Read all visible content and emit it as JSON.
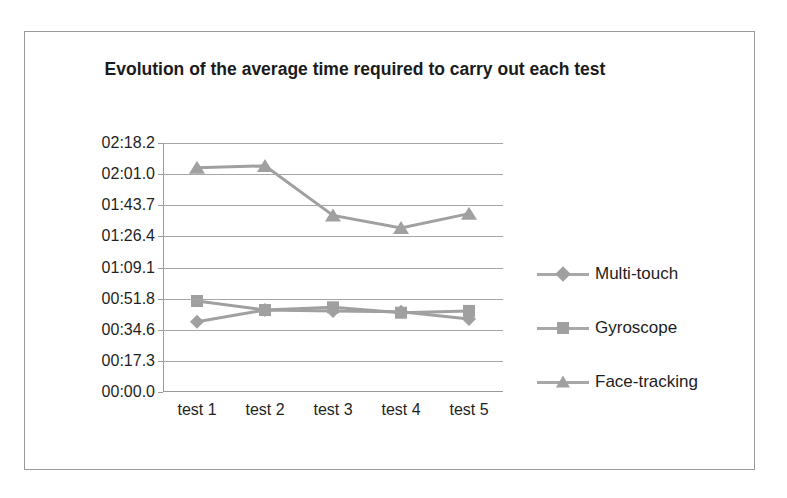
{
  "top_cut_text": "",
  "chart_data": {
    "type": "line",
    "title": "Evolution of the average time required to carry out each test",
    "xlabel": "",
    "ylabel": "",
    "categories": [
      "test 1",
      "test 2",
      "test 3",
      "test 4",
      "test 5"
    ],
    "y_tick_labels": [
      "02:18.2",
      "02:01.0",
      "01:43.7",
      "01:26.4",
      "01:09.1",
      "00:51.8",
      "00:34.6",
      "00:17.3",
      "00:00.0"
    ],
    "y_tick_seconds": [
      138.2,
      121.0,
      103.7,
      86.4,
      69.1,
      51.8,
      34.6,
      17.3,
      0.0
    ],
    "ylim_seconds": [
      0.0,
      138.2
    ],
    "grid": true,
    "legend_position": "right",
    "series": [
      {
        "name": "Multi-touch",
        "marker": "diamond",
        "color": "#a0a0a0",
        "values_seconds": [
          39.0,
          45.5,
          45.0,
          44.5,
          40.5
        ],
        "values_labels": [
          "00:39.0",
          "00:45.5",
          "00:45.0",
          "00:44.5",
          "00:40.5"
        ]
      },
      {
        "name": "Gyroscope",
        "marker": "square",
        "color": "#a0a0a0",
        "values_seconds": [
          50.5,
          45.5,
          47.0,
          44.0,
          45.0
        ],
        "values_labels": [
          "00:50.5",
          "00:45.5",
          "00:47.0",
          "00:44.0",
          "00:45.0"
        ]
      },
      {
        "name": "Face-tracking",
        "marker": "triangle",
        "color": "#a0a0a0",
        "values_seconds": [
          124.5,
          125.5,
          98.0,
          91.0,
          99.0
        ],
        "values_labels": [
          "02:04.5",
          "02:05.5",
          "01:38.0",
          "01:31.0",
          "01:39.0"
        ]
      }
    ]
  },
  "legend": {
    "items": [
      {
        "label": "Multi-touch"
      },
      {
        "label": "Gyroscope"
      },
      {
        "label": "Face-tracking"
      }
    ]
  },
  "colors": {
    "series": "#a0a0a0",
    "gridline": "#a6a6a6",
    "frame": "#9a9a9a",
    "text": "#1f1f1f",
    "background": "#ffffff"
  }
}
